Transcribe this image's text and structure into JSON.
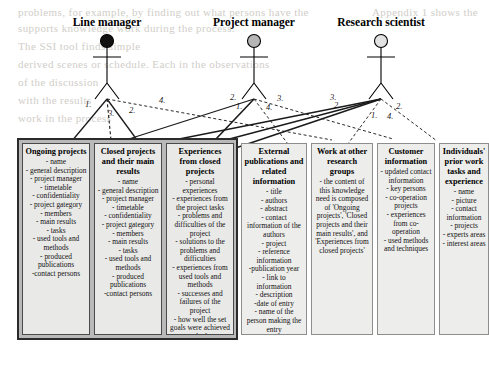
{
  "diagram": {
    "type": "uml-use-case-knowledge-needs",
    "actors": [
      {
        "id": "line-manager",
        "label": "Line manager",
        "head_fill": "#111111",
        "cx": 107,
        "head_cy": 41
      },
      {
        "id": "project-manager",
        "label": "Project manager",
        "head_fill": "#b5b5b5",
        "cx": 254,
        "head_cy": 41
      },
      {
        "id": "research-scientist",
        "label": "Research scientist",
        "head_fill": "#e2e2e2",
        "cx": 381,
        "head_cy": 41
      }
    ],
    "connector_labels": [
      {
        "text": "1.",
        "x": 85,
        "y": 99
      },
      {
        "text": "2.",
        "x": 129,
        "y": 105
      },
      {
        "text": "3.",
        "x": 108,
        "y": 108
      },
      {
        "text": "4.",
        "x": 159,
        "y": 95
      },
      {
        "text": "2.",
        "x": 230,
        "y": 92
      },
      {
        "text": "1.",
        "x": 236,
        "y": 101
      },
      {
        "text": "3.",
        "x": 277,
        "y": 93
      },
      {
        "text": "4.",
        "x": 266,
        "y": 102
      },
      {
        "text": "3.",
        "x": 330,
        "y": 92
      },
      {
        "text": "2.",
        "x": 334,
        "y": 100
      },
      {
        "text": "2.",
        "x": 396,
        "y": 101
      },
      {
        "text": "1.",
        "x": 371,
        "y": 110
      },
      {
        "text": "4.",
        "x": 387,
        "y": 111
      }
    ],
    "boxes": [
      {
        "id": "ongoing-projects",
        "title": "Ongoing projects",
        "in_group": true,
        "items": [
          "- name",
          "- general description",
          "- project manager",
          "- timetable",
          "- confidentiality",
          "- project gategory",
          "- members",
          "- main results",
          "- tasks",
          "- used tools and methods",
          "- produced publications",
          "-contact persons"
        ]
      },
      {
        "id": "closed-projects",
        "title": "Closed projects and their main results",
        "in_group": true,
        "items": [
          "- name",
          "- general description",
          "- project manager",
          "- timetable",
          "- confidentiality",
          "- project gategory",
          "- members",
          "- main results",
          "- tasks",
          "- used tools and methods",
          "- produced publications",
          "-contact persons"
        ]
      },
      {
        "id": "experiences-closed-projects",
        "title": "Experiences from closed projects",
        "in_group": true,
        "items": [
          "- personal experiences",
          "- experiences from the project tasks",
          "- problems and difficulties of the project",
          "- solutions to the problems and difficulties",
          "- experiences from used tools and methods",
          "- successes and failures of the project",
          "- how well the set goals were achieved and why"
        ]
      },
      {
        "id": "external-publications",
        "title": "External publications and related information",
        "in_group": false,
        "items": [
          "- title",
          "- authors",
          "- abstract",
          "- contact information of the authors",
          "- project",
          "- reference information",
          "-publication year",
          "- link to information",
          "- description",
          "-date of entry",
          "- name of the person making the entry"
        ]
      },
      {
        "id": "work-other-research-groups",
        "title": "Work at other research groups",
        "in_group": false,
        "paragraph": "- the content of this knowledge need is composed of 'Ongoing projects', 'Closed projects and their main results', and 'Experiences from closed projects'"
      },
      {
        "id": "customer-information",
        "title": "Customer information",
        "in_group": false,
        "items": [
          "- updated contact information",
          "- key persons",
          "- co-operation projects",
          "- experiences from co-operation",
          "- used methods and techniques"
        ]
      },
      {
        "id": "individuals-prior-work",
        "title": "Individuals' prior work tasks and experience",
        "in_group": false,
        "items": [
          "- name",
          "- picture",
          "- contact information",
          "- projects",
          "- experts areas",
          "- interest areas"
        ]
      }
    ]
  },
  "background_text": [
    {
      "text": "problems, for example, by finding out what persons have the",
      "x": 18,
      "y": 6
    },
    {
      "text": "Appendix 1 shows the",
      "x": 372,
      "y": 6
    },
    {
      "text": "supports knowledge work during the process.",
      "x": 18,
      "y": 22
    },
    {
      "text": "The SSI tool finds simple",
      "x": 18,
      "y": 40
    },
    {
      "text": "derived scenes or schedule. Each in the observations",
      "x": 18,
      "y": 58
    },
    {
      "text": "of the discussion",
      "x": 18,
      "y": 76
    },
    {
      "text": "with the results",
      "x": 18,
      "y": 94
    },
    {
      "text": "work in the process",
      "x": 18,
      "y": 112
    }
  ]
}
